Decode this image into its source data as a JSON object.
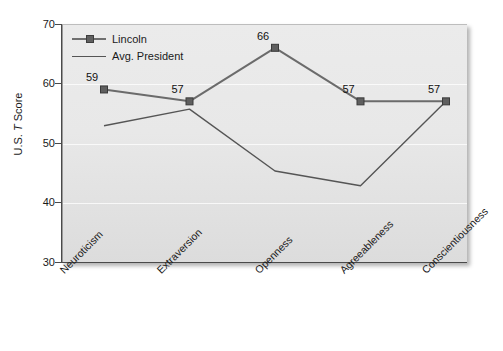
{
  "chart_data": {
    "type": "line",
    "title": "",
    "xlabel": "",
    "ylabel": "U.S. T Score",
    "ylabel_parts": {
      "prefix": "U.S. ",
      "italic": "T",
      "suffix": " Score"
    },
    "categories": [
      "Neuroticism",
      "Extraversion",
      "Openness",
      "Agreeableness",
      "Conscientiousness"
    ],
    "ylim": [
      30,
      70
    ],
    "yticks": [
      30,
      40,
      50,
      60,
      70
    ],
    "ytick_labels": [
      "30",
      "40",
      "50",
      "60",
      "70"
    ],
    "grid": true,
    "legend_position": "top-left",
    "series": [
      {
        "name": "Lincoln",
        "values": [
          59,
          57,
          66,
          57,
          57
        ],
        "data_labels": [
          "59",
          "57",
          "66",
          "57",
          "57"
        ],
        "marker": "square",
        "color": "#6b6b6b"
      },
      {
        "name": "Avg. President",
        "values": [
          52.9,
          55.7,
          45.3,
          42.8,
          57
        ],
        "data_labels": [
          "",
          "",
          "",
          "",
          ""
        ],
        "marker": "none",
        "color": "#555555"
      }
    ]
  },
  "legend": {
    "items": [
      {
        "label": "Lincoln"
      },
      {
        "label": "Avg. President"
      }
    ]
  },
  "colors": {
    "lincoln_line": "#6b6b6b",
    "avg_line": "#555555",
    "panel_bg": "#e7e7e7",
    "axis": "#4a4a4a",
    "text": "#1a1a1a"
  }
}
